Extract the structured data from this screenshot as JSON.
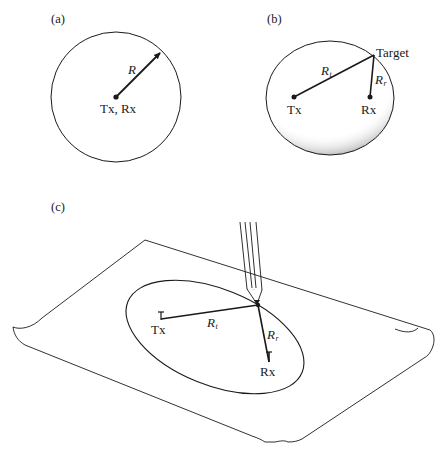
{
  "figure": {
    "panels": [
      {
        "id": "a",
        "label": "(a)",
        "radius_label": "R",
        "station_label": "Tx, Rx"
      },
      {
        "id": "b",
        "label": "(b)",
        "target_label": "Target",
        "transmit_range_symbol": "R",
        "transmit_range_subscript": "t",
        "receive_range_symbol": "R",
        "receive_range_subscript": "r",
        "transmitter_label": "Tx",
        "receiver_label": "Rx"
      },
      {
        "id": "c",
        "label": "(c)",
        "transmit_range_symbol": "R",
        "transmit_range_subscript": "t",
        "receive_range_symbol": "R",
        "receive_range_subscript": "r",
        "transmitter_label": "Tx",
        "receiver_label": "Rx"
      }
    ],
    "colors": {
      "ink": "#1a1a1a",
      "background": "#ffffff"
    }
  }
}
